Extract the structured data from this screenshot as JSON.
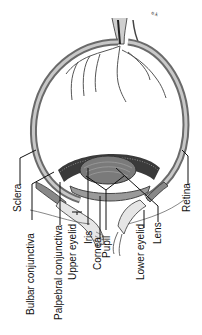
{
  "figure": {
    "artist_mark": "e.k",
    "orientation": "labels rotated 90 degrees counter-clockwise"
  },
  "labels": [
    {
      "id": "sclera",
      "text": "Sclera"
    },
    {
      "id": "bulbar-conjunctiva",
      "text": "Bulbar conjunctiva"
    },
    {
      "id": "palpebral-conjunctiva",
      "text": "Palpebral conjunctiva"
    },
    {
      "id": "upper-eyelid",
      "text": "Upper eyelid"
    },
    {
      "id": "iris",
      "text": "Iris"
    },
    {
      "id": "cornea",
      "text": "Cornea"
    },
    {
      "id": "pupil",
      "text": "Pupil"
    },
    {
      "id": "lower-eyelid",
      "text": "Lower eyelid"
    },
    {
      "id": "lens",
      "text": "Lens"
    },
    {
      "id": "retina",
      "text": "Retina"
    }
  ],
  "colors": {
    "ink": "#111111",
    "sclera_fill": "#8a8a8a",
    "sclera_light": "#c8c8c8",
    "ciliary_dark": "#3a3a3a",
    "lens_fill": "#6e6e6e",
    "skin": "#e6e6e6"
  }
}
